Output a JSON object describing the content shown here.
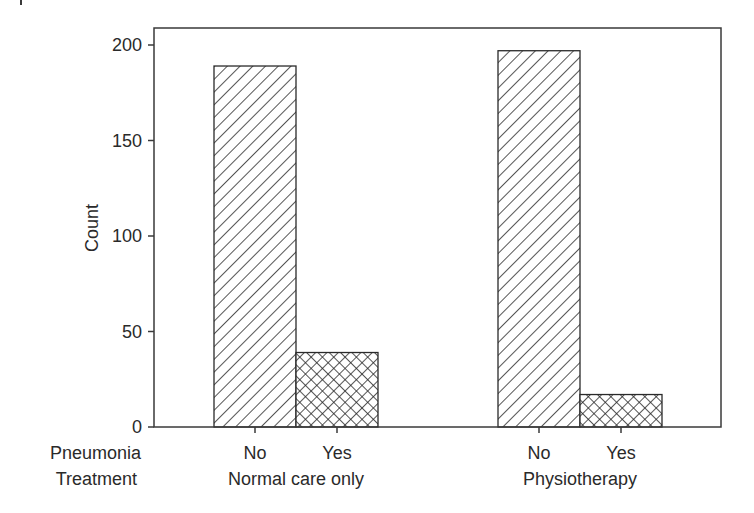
{
  "chart_data": {
    "type": "bar",
    "title": "",
    "xlabel": "",
    "ylabel": "Count",
    "ylim": [
      0,
      209
    ],
    "yticks": [
      0,
      50,
      100,
      150,
      200
    ],
    "row_labels": {
      "inner": "Pneumonia",
      "outer": "Treatment"
    },
    "groups": [
      {
        "name": "Normal care only",
        "bars": [
          {
            "category": "No",
            "value": 189,
            "pattern": "diagonal-hatch"
          },
          {
            "category": "Yes",
            "value": 39,
            "pattern": "cross-hatch"
          }
        ]
      },
      {
        "name": "Physiotherapy",
        "bars": [
          {
            "category": "No",
            "value": 197,
            "pattern": "diagonal-hatch"
          },
          {
            "category": "Yes",
            "value": 17,
            "pattern": "cross-hatch"
          }
        ]
      }
    ],
    "grid": false,
    "legend": "none"
  },
  "colors": {
    "axis": "#3a3a3a",
    "bar_stroke": "#2a2a2a",
    "bar_fill": "#ffffff"
  }
}
